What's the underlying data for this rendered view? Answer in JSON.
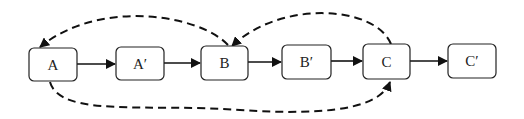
{
  "diagram": {
    "type": "flow",
    "nodes": [
      {
        "id": "A",
        "label": "A",
        "x": 29,
        "y": 48,
        "w": 48,
        "h": 33
      },
      {
        "id": "A2",
        "label": "A′",
        "x": 116,
        "y": 47,
        "w": 48,
        "h": 33
      },
      {
        "id": "B",
        "label": "B",
        "x": 201,
        "y": 46,
        "w": 47,
        "h": 34
      },
      {
        "id": "B2",
        "label": "B′",
        "x": 282,
        "y": 45,
        "w": 49,
        "h": 34
      },
      {
        "id": "C",
        "label": "C",
        "x": 363,
        "y": 44,
        "w": 47,
        "h": 35
      },
      {
        "id": "C2",
        "label": "C′",
        "x": 448,
        "y": 44,
        "w": 48,
        "h": 34
      }
    ],
    "edges": [
      {
        "from": "A",
        "to": "A′",
        "style": "solid"
      },
      {
        "from": "A′",
        "to": "B",
        "style": "solid"
      },
      {
        "from": "B",
        "to": "B′",
        "style": "solid"
      },
      {
        "from": "B′",
        "to": "C",
        "style": "solid"
      },
      {
        "from": "C",
        "to": "C′",
        "style": "solid"
      },
      {
        "from": "B",
        "to": "A",
        "style": "dashed",
        "route": "over"
      },
      {
        "from": "C",
        "to": "B",
        "style": "dashed",
        "route": "over"
      },
      {
        "from": "A",
        "to": "C",
        "style": "dashed",
        "route": "under"
      }
    ]
  }
}
